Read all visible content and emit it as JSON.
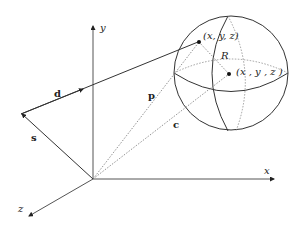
{
  "diagram": {
    "type": "3d-vector-sphere",
    "axes": {
      "x_label": "x",
      "y_label": "y",
      "z_label": "z"
    },
    "vectors": {
      "d_label": "d",
      "s_label": "s",
      "p_label": "p",
      "c_label": "c"
    },
    "sphere": {
      "radius_label": "R",
      "surface_point_label": "(x, y, z)",
      "center_point_label": "(x , y , z )"
    },
    "colors": {
      "line": "#333333",
      "axis": "#555555",
      "dotted": "#777777",
      "background": "#ffffff"
    }
  }
}
